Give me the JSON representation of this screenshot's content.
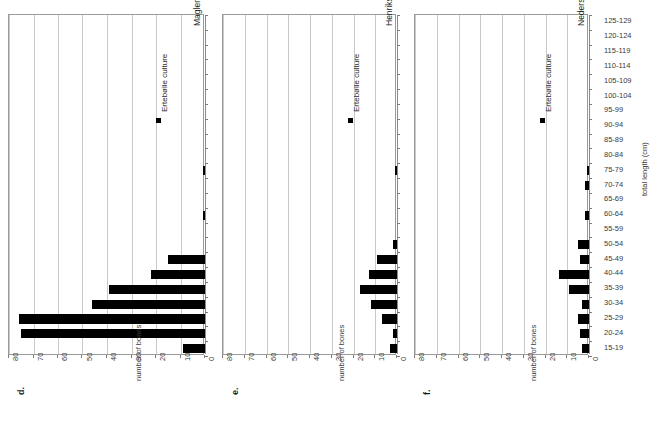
{
  "figure": {
    "width": 659,
    "height": 421,
    "background": "#ffffff",
    "bar_color": "#000000",
    "grid_color": "#c9c9c9",
    "axis_color": "#8a8a8a",
    "category_axis_title": "total length (cm)",
    "value_axis_title": "number of bones",
    "legend_label": "Ertebølle culture",
    "legend_marker": "filled-square-marker",
    "categories": [
      "15-19",
      "20-24",
      "25-29",
      "30-34",
      "35-39",
      "40-44",
      "45-49",
      "50-54",
      "55-59",
      "60-64",
      "65-69",
      "70-74",
      "75-79",
      "80-84",
      "85-89",
      "90-94",
      "95-99",
      "100-104",
      "105-109",
      "110-114",
      "115-119",
      "120-124",
      "125-129"
    ],
    "value_ticks": [
      0,
      10,
      20,
      30,
      40,
      50,
      60,
      70,
      80
    ],
    "value_axis_max": 80
  },
  "chart_data": [
    {
      "type": "bar",
      "panel_letter": "d.",
      "title": "Maglemosegård, n = 284",
      "site": "Maglemosegård",
      "n": 284,
      "legend": [
        "Ertebølle culture"
      ],
      "orientation": "horizontal",
      "xlabel": "number of bones",
      "ylabel": "total length (cm)",
      "xlim": [
        0,
        80
      ],
      "grid": true,
      "legend_position": "top-left",
      "categories": [
        "15-19",
        "20-24",
        "25-29",
        "30-34",
        "35-39",
        "40-44",
        "45-49",
        "50-54",
        "55-59",
        "60-64",
        "65-69",
        "70-74",
        "75-79",
        "80-84",
        "85-89",
        "90-94",
        "95-99",
        "100-104",
        "105-109",
        "110-114",
        "115-119",
        "120-124",
        "125-129"
      ],
      "values": [
        9,
        75,
        76,
        46,
        39,
        22,
        15,
        0,
        0,
        1,
        0,
        0,
        1,
        0,
        0,
        0,
        0,
        0,
        0,
        0,
        0,
        0,
        0
      ]
    },
    {
      "type": "bar",
      "panel_letter": "e.",
      "title": "Henriksholm-Bøgebakken, n = 66",
      "site": "Henriksholm-Bøgebakken",
      "n": 66,
      "legend": [
        "Ertebølle culture"
      ],
      "orientation": "horizontal",
      "xlabel": "number of bones",
      "ylabel": "total length (cm)",
      "xlim": [
        0,
        80
      ],
      "grid": true,
      "legend_position": "top-left",
      "categories": [
        "15-19",
        "20-24",
        "25-29",
        "30-34",
        "35-39",
        "40-44",
        "45-49",
        "50-54",
        "55-59",
        "60-64",
        "65-69",
        "70-74",
        "75-79",
        "80-84",
        "85-89",
        "90-94",
        "95-99",
        "100-104",
        "105-109",
        "110-114",
        "115-119",
        "120-124",
        "125-129"
      ],
      "values": [
        3,
        2,
        7,
        12,
        17,
        13,
        9,
        2,
        0,
        0,
        0,
        0,
        1,
        0,
        0,
        0,
        0,
        0,
        0,
        0,
        0,
        0,
        0
      ]
    },
    {
      "type": "bar",
      "panel_letter": "f.",
      "title": "Nederst, n = 55",
      "site": "Nederst",
      "n": 55,
      "legend": [
        "Ertebølle culture"
      ],
      "orientation": "horizontal",
      "xlabel": "number of bones",
      "ylabel": "total length (cm)",
      "xlim": [
        0,
        80
      ],
      "grid": true,
      "legend_position": "top-left",
      "categories": [
        "15-19",
        "20-24",
        "25-29",
        "30-34",
        "35-39",
        "40-44",
        "45-49",
        "50-54",
        "55-59",
        "60-64",
        "65-69",
        "70-74",
        "75-79",
        "80-84",
        "85-89",
        "90-94",
        "95-99",
        "100-104",
        "105-109",
        "110-114",
        "115-119",
        "120-124",
        "125-129"
      ],
      "values": [
        3,
        4,
        5,
        3,
        9,
        14,
        4,
        5,
        0,
        2,
        0,
        2,
        1,
        0,
        0,
        0,
        0,
        0,
        0,
        0,
        0,
        0,
        0
      ]
    }
  ]
}
